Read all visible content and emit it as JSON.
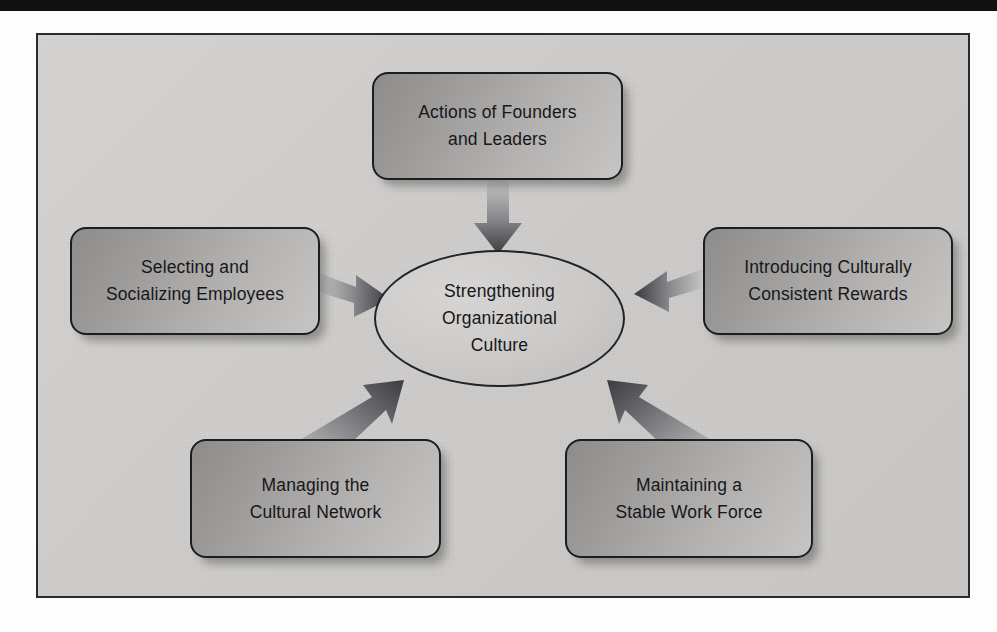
{
  "page": {
    "ghost_text": "",
    "frame_background": "#cecdcb",
    "box_fill_dark": "#8d8c8a",
    "box_fill_light": "#c6c5c3",
    "outline_color": "#1d1c1e",
    "text_color": "#17161a"
  },
  "diagram": {
    "type": "hub-and-spoke",
    "center": {
      "id": "center-ellipse",
      "label": "Strengthening\nOrganizational\nCulture",
      "shape": "ellipse"
    },
    "nodes": [
      {
        "id": "node-top",
        "label": "Actions of Founders\nand Leaders",
        "shape": "rounded-rectangle",
        "position": "top",
        "arrow_direction": "down"
      },
      {
        "id": "node-left",
        "label": "Selecting and\nSocializing Employees",
        "shape": "rounded-rectangle",
        "position": "left",
        "arrow_direction": "right"
      },
      {
        "id": "node-right",
        "label": "Introducing Culturally\nConsistent Rewards",
        "shape": "rounded-rectangle",
        "position": "right",
        "arrow_direction": "left"
      },
      {
        "id": "node-bottom-left",
        "label": "Managing the\nCultural Network",
        "shape": "rounded-rectangle",
        "position": "bottom-left",
        "arrow_direction": "up-right"
      },
      {
        "id": "node-bottom-right",
        "label": "Maintaining a\nStable Work Force",
        "shape": "rounded-rectangle",
        "position": "bottom-right",
        "arrow_direction": "up-left"
      }
    ]
  }
}
